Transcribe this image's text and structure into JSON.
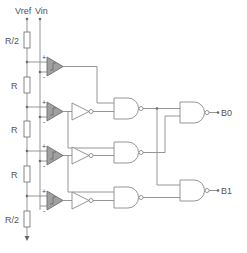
{
  "diagram": {
    "inputs": {
      "vref_label": "Vref",
      "vin_label": "Vin"
    },
    "resistors": [
      {
        "label": "R/2"
      },
      {
        "label": "R"
      },
      {
        "label": "R"
      },
      {
        "label": "R"
      },
      {
        "label": "R/2"
      }
    ],
    "comparator_pins": {
      "plus": "+",
      "minus": "-"
    },
    "outputs": {
      "b0_label": "B0",
      "b1_label": "B1"
    },
    "colors": {
      "wire": "#8a8a8a",
      "comparator_fill": "#a0a0a0",
      "background": "#ffffff"
    }
  }
}
